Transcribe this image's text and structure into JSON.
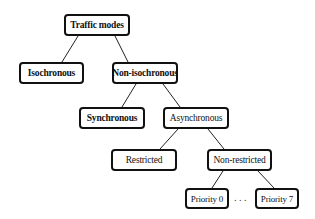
{
  "diagram": {
    "type": "tree",
    "nodes": {
      "root": "Traffic modes",
      "isochronous": "Isochronous",
      "non_isochronous": "Non-isochronous",
      "synchronous": "Synchronous",
      "asynchronous": "Asynchronous",
      "restricted": "Restricted",
      "non_restricted": "Non-restricted",
      "priority_0": "Priority 0",
      "priority_7": "Priority 7"
    },
    "ellipsis": ". . .",
    "edges": [
      [
        "Traffic modes",
        "Isochronous"
      ],
      [
        "Traffic modes",
        "Non-isochronous"
      ],
      [
        "Non-isochronous",
        "Synchronous"
      ],
      [
        "Non-isochronous",
        "Asynchronous"
      ],
      [
        "Asynchronous",
        "Restricted"
      ],
      [
        "Asynchronous",
        "Non-restricted"
      ],
      [
        "Non-restricted",
        "Priority 0"
      ],
      [
        "Non-restricted",
        "Priority 7"
      ]
    ],
    "colors": {
      "stroke": "#111111",
      "background": "#ffffff",
      "text": "#111111"
    }
  }
}
